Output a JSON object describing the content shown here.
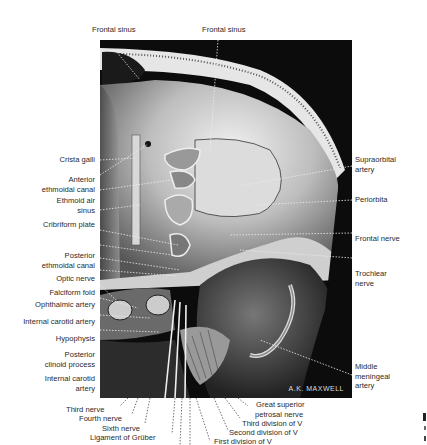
{
  "figure": {
    "signature": "A.K. MAXWELL",
    "top_labels": [
      "Frontal sinus",
      "Frontal sinus"
    ],
    "left_labels": [
      [
        "Crista galli"
      ],
      [
        "Anterior",
        "ethmoidal canal"
      ],
      [
        "Ethmoid air",
        "sinus"
      ],
      [
        "Cribriform plate"
      ],
      [
        "Posterior",
        "ethmoidal canal"
      ],
      [
        "Optic nerve"
      ],
      [
        "Falciform fold"
      ],
      [
        "Ophthalmic artery"
      ],
      [
        "Internal carotid artery"
      ],
      [
        "Hypophysis"
      ],
      [
        "Posterior",
        "clinoid process"
      ],
      [
        "Internal carotid",
        "artery"
      ]
    ],
    "right_labels": [
      [
        "Supraorbital",
        "artery"
      ],
      [
        "Periorbita"
      ],
      [
        "Frontal nerve"
      ],
      [
        "Trochlear",
        "nerve"
      ],
      [
        "Middle",
        "meningeal",
        "artery"
      ]
    ],
    "bottom_labels": [
      "Third nerve",
      "Fourth nerve",
      "Sixth nerve",
      "Ligament of Grüber",
      "Great superior",
      "petrosal nerve",
      "Third division of V",
      "Second division of V",
      "First division of V"
    ]
  }
}
